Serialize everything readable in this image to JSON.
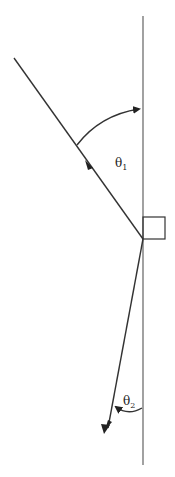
{
  "diagram": {
    "labels": {
      "theta1": "θ",
      "theta1_sub": "1",
      "theta2": "θ",
      "theta2_sub": "2"
    },
    "elements": [
      "vertical-boundary",
      "incident-ray",
      "outgoing-ray",
      "right-angle-box",
      "angle-arc-theta1",
      "angle-arc-theta2"
    ]
  }
}
